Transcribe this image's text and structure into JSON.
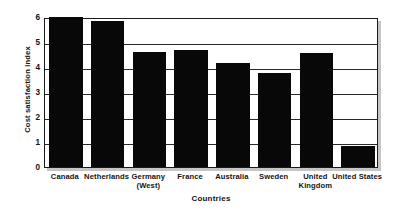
{
  "chart_data": {
    "type": "bar",
    "title": "",
    "xlabel": "Countries",
    "ylabel": "Cost satisfaction index",
    "categories": [
      "Canada",
      "Netherlands",
      "Germany (West)",
      "France",
      "Australia",
      "Sweden",
      "United Kingdom",
      "United States"
    ],
    "category_lines": [
      [
        "Canada"
      ],
      [
        "Netherlands"
      ],
      [
        "Germany",
        "(West)"
      ],
      [
        "France"
      ],
      [
        "Australia"
      ],
      [
        "Sweden"
      ],
      [
        "United",
        "Kingdom"
      ],
      [
        "United States"
      ]
    ],
    "values": [
      6.0,
      5.85,
      4.6,
      4.7,
      4.15,
      3.75,
      4.55,
      0.85
    ],
    "ylim": [
      0,
      6
    ],
    "yticks": [
      0,
      1,
      2,
      3,
      4,
      5,
      6
    ],
    "ytick_labels": [
      "0",
      "1",
      "2",
      "3",
      "4",
      "5",
      "6"
    ],
    "grid": true,
    "grid_axis": "y",
    "legend": false,
    "bar_color": "#080808",
    "frame_color": "#1a1a1a",
    "background_color": "#ffffff"
  }
}
